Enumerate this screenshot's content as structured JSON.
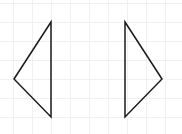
{
  "diagram": {
    "background": "#ffffff",
    "grid": {
      "color": "#f0f0f0",
      "spacing": 19,
      "offset_x": 13,
      "offset_y": 3
    },
    "stroke_color": "#1a1a1a",
    "stroke_width": 1.5,
    "shapes": [
      {
        "name": "left-pointing-triangle",
        "points": "51,22 14,79 51,117"
      },
      {
        "name": "right-pointing-triangle",
        "points": "125,22 162,79 125,117"
      }
    ]
  }
}
